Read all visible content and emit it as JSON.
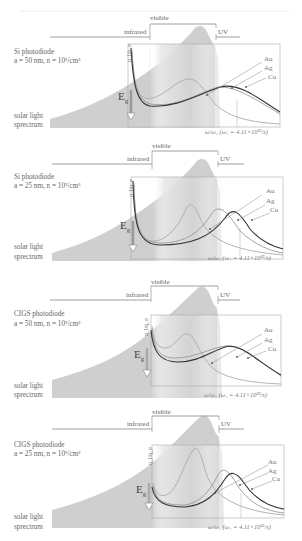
{
  "figure": {
    "regions": {
      "visible": "visible",
      "infrared": "infrared",
      "uv": "UV"
    },
    "spectrum_label_line1": "solar light",
    "spectrum_label_line2": "sprectrum",
    "bandgap_label": "E",
    "bandgap_sub": "g",
    "y_axis_label": "q_l/q_e",
    "x_axis_label": "ω/ω₁ (ω₁ = 4.11×10¹⁵/s)",
    "metals": [
      "Au",
      "Ag",
      "Cu"
    ],
    "colors": {
      "spectrum_fill": "#c8c8c8",
      "visible_band": "#e2e2e2",
      "curve_au": "#999999",
      "curve_ag": "#b8b8b8",
      "curve_cu": "#444444",
      "box": "#aaaaaa",
      "text": "#666666"
    }
  },
  "panels": [
    {
      "id": "si-50",
      "device": "Si photodiode",
      "params": "a = 50 nm, n = 10⁵/cm³",
      "box": {
        "x": 128,
        "y": 44,
        "w": 152,
        "h": 83
      },
      "eg_x": 131
    },
    {
      "id": "si-25",
      "device": "Si photodiode",
      "params": "a = 25 nm, n = 10⁵/cm³",
      "box": {
        "x": 131,
        "y": 44,
        "w": 152,
        "h": 82
      },
      "eg_x": 133
    },
    {
      "id": "cigs-50",
      "device": "CIGS photodiode",
      "params": "a = 50 nm, n = 10⁵/cm³",
      "box": {
        "x": 151,
        "y": 45,
        "w": 130,
        "h": 71
      },
      "eg_x": 151
    },
    {
      "id": "cigs-25",
      "device": "CIGS photodiode",
      "params": "a = 25 nm, n = 10⁵/cm³",
      "box": {
        "x": 152,
        "y": 42,
        "w": 132,
        "h": 73
      },
      "eg_x": 152
    }
  ]
}
